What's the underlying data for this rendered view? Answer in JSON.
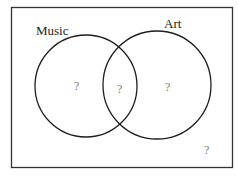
{
  "diagram": {
    "type": "venn",
    "universal_set": {
      "label": "",
      "region_value": "?"
    },
    "sets": [
      {
        "name": "Music",
        "label": "Music",
        "only_value": "?"
      },
      {
        "name": "Art",
        "label": "Art",
        "only_value": "?"
      }
    ],
    "intersection": {
      "sets": [
        "Music",
        "Art"
      ],
      "value": "?"
    },
    "colors": {
      "stroke": "#1e1e1e",
      "unknown_text": "#777777",
      "background": "#ffffff"
    }
  }
}
